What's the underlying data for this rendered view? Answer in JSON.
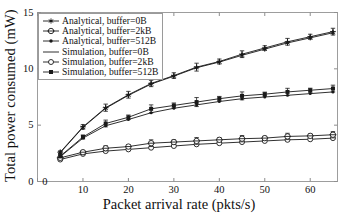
{
  "chart_data": {
    "type": "line",
    "title": "",
    "xlabel": "Packet arrival rate (pkts/s)",
    "ylabel": "Total power consumed (mW)",
    "xlim": [
      0,
      66
    ],
    "ylim": [
      0,
      15
    ],
    "xticks": [
      0,
      10,
      20,
      30,
      40,
      50,
      60
    ],
    "yticks": [
      0,
      5,
      10,
      15
    ],
    "xtick_labels": [
      "0",
      "10",
      "20",
      "30",
      "40",
      "50",
      "60"
    ],
    "ytick_labels": [
      "0",
      "5",
      "10",
      "15"
    ],
    "grid": false,
    "legend_position": "upper left",
    "x": [
      5,
      10,
      15,
      20,
      25,
      30,
      35,
      40,
      45,
      50,
      55,
      60,
      65
    ],
    "series": [
      {
        "name": "Analytical, buffer=0B",
        "marker": "asterisk",
        "filled": true,
        "errorbars": false,
        "values": [
          2.55,
          4.8,
          6.5,
          7.65,
          8.65,
          9.35,
          10.1,
          10.6,
          11.2,
          11.75,
          12.3,
          12.75,
          13.2
        ]
      },
      {
        "name": "Analytical, buffer=2kB",
        "marker": "circle-open",
        "filled": false,
        "errorbars": false,
        "values": [
          1.95,
          2.45,
          2.7,
          2.85,
          3.0,
          3.15,
          3.3,
          3.4,
          3.5,
          3.6,
          3.7,
          3.75,
          3.85
        ]
      },
      {
        "name": "Analytical, buffer=512B",
        "marker": "dot-small",
        "filled": true,
        "errorbars": false,
        "values": [
          2.2,
          3.85,
          4.95,
          5.5,
          6.1,
          6.5,
          6.8,
          7.1,
          7.35,
          7.5,
          7.65,
          7.8,
          7.95
        ]
      },
      {
        "name": "Simulation, buffer=0B",
        "marker": "plus",
        "filled": true,
        "errorbars": true,
        "values": [
          2.6,
          4.85,
          6.55,
          7.7,
          8.7,
          9.4,
          10.15,
          10.65,
          11.3,
          11.85,
          12.4,
          12.85,
          13.3
        ],
        "errors": [
          0.12,
          0.2,
          0.32,
          0.3,
          0.28,
          0.25,
          0.35,
          0.22,
          0.3,
          0.2,
          0.3,
          0.22,
          0.3
        ]
      },
      {
        "name": "Simulation, buffer=2kB",
        "marker": "circle-plus",
        "filled": false,
        "errorbars": true,
        "values": [
          2.1,
          2.6,
          2.95,
          3.1,
          3.4,
          3.5,
          3.6,
          3.7,
          3.8,
          3.85,
          4.0,
          4.05,
          4.15
        ],
        "errors": [
          0.12,
          0.15,
          0.22,
          0.18,
          0.3,
          0.2,
          0.3,
          0.18,
          0.28,
          0.16,
          0.28,
          0.16,
          0.28
        ]
      },
      {
        "name": "Simulation, buffer=512B",
        "marker": "square-filled",
        "filled": true,
        "errorbars": true,
        "values": [
          2.25,
          3.95,
          5.15,
          5.7,
          6.45,
          6.75,
          7.05,
          7.35,
          7.6,
          7.75,
          7.95,
          8.1,
          8.25
        ],
        "errors": [
          0.12,
          0.18,
          0.3,
          0.2,
          0.35,
          0.22,
          0.4,
          0.2,
          0.35,
          0.18,
          0.32,
          0.18,
          0.3
        ]
      }
    ]
  },
  "legend": {
    "items": [
      {
        "label": "Analytical, buffer=0B",
        "symbol": "asterisk"
      },
      {
        "label": "Analytical, buffer=2kB",
        "symbol": "circle-plus"
      },
      {
        "label": "Analytical, buffer=512B",
        "symbol": "dot-line"
      },
      {
        "label": "Simulation, buffer=0B",
        "symbol": "line-plain"
      },
      {
        "label": "Simulation, buffer=2kB",
        "symbol": "circle-open-line"
      },
      {
        "label": "Simulation, buffer=512B",
        "symbol": "square-filled"
      }
    ]
  },
  "axes": {
    "xlabel": "Packet arrival rate (pkts/s)",
    "ylabel": "Total power consumed (mW)"
  }
}
